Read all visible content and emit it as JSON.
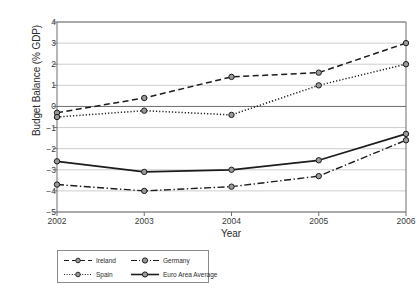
{
  "chart_data": {
    "type": "line",
    "title": "",
    "xlabel": "Year",
    "ylabel": "Budget Balance (% GDP)",
    "categories": [
      "2002",
      "2003",
      "2004",
      "2005",
      "2006"
    ],
    "x": [
      2002,
      2003,
      2004,
      2005,
      2006
    ],
    "xlim": [
      2002,
      2006
    ],
    "ylim": [
      -5,
      4
    ],
    "yticks": [
      "4",
      "3",
      "2",
      "1",
      "0",
      "-1",
      "-2",
      "-3",
      "-4",
      "-5"
    ],
    "ytick_values": [
      4,
      3,
      2,
      1,
      0,
      -1,
      -2,
      -3,
      -4,
      -5
    ],
    "grid": true,
    "grid_axis": "y",
    "legend_position": "below-left",
    "series": [
      {
        "name": "Ireland",
        "style": "dashed",
        "values": [
          -0.3,
          0.4,
          1.4,
          1.6,
          3.0
        ]
      },
      {
        "name": "Spain",
        "style": "dotted",
        "values": [
          -0.5,
          -0.2,
          -0.4,
          1.0,
          2.0
        ]
      },
      {
        "name": "Germany",
        "style": "dash-dot",
        "values": [
          -3.7,
          -4.0,
          -3.8,
          -3.3,
          -1.6
        ]
      },
      {
        "name": "Euro Area Average",
        "style": "solid",
        "values": [
          -2.6,
          -3.1,
          -3.0,
          -2.55,
          -1.3
        ]
      }
    ],
    "colors": {
      "line": "#1c1c1c",
      "grid": "#b9b9b9",
      "axis": "#6e6e6e",
      "marker_fill": "#9a9a9a",
      "background": "#ffffff"
    }
  }
}
